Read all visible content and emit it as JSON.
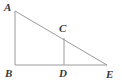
{
  "figure": {
    "kind": "geometry-diagram",
    "background_color": "#ffffff",
    "line_color": "#9a9a9a",
    "label_color": "#3a3a3a",
    "line_width": 1,
    "width": 122,
    "height": 84
  },
  "points": {
    "A": {
      "label": "A",
      "x": 15,
      "y": 11
    },
    "B": {
      "label": "B",
      "x": 15,
      "y": 65
    },
    "C": {
      "label": "C",
      "x": 64,
      "y": 38
    },
    "D": {
      "label": "D",
      "x": 64,
      "y": 65
    },
    "E": {
      "label": "E",
      "x": 107,
      "y": 65
    }
  },
  "segments": [
    {
      "name": "AB",
      "from": "A",
      "to": "B"
    },
    {
      "name": "BE",
      "from": "B",
      "to": "E"
    },
    {
      "name": "AE",
      "from": "A",
      "to": "E"
    },
    {
      "name": "CD",
      "from": "C",
      "to": "D"
    }
  ],
  "labels": {
    "A": "A",
    "B": "B",
    "C": "C",
    "D": "D",
    "E": "E"
  }
}
